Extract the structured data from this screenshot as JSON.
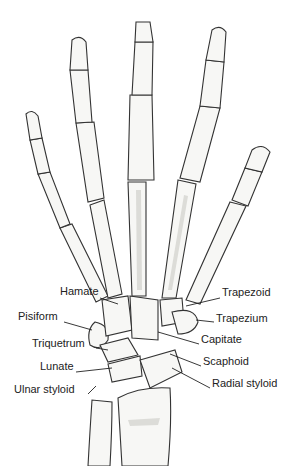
{
  "diagram": {
    "labels_left": [
      {
        "text": "Hamate",
        "x": 60,
        "y": 291
      },
      {
        "text": "Pisiform",
        "x": 18,
        "y": 316
      },
      {
        "text": "Triquetrum",
        "x": 32,
        "y": 343
      },
      {
        "text": "Lunate",
        "x": 40,
        "y": 366
      },
      {
        "text": "Ulnar styloid",
        "x": 14,
        "y": 389
      }
    ],
    "labels_right": [
      {
        "text": "Trapezoid",
        "x": 222,
        "y": 292
      },
      {
        "text": "Trapezium",
        "x": 216,
        "y": 318
      },
      {
        "text": "Capitate",
        "x": 201,
        "y": 339
      },
      {
        "text": "Scaphoid",
        "x": 203,
        "y": 361
      },
      {
        "text": "Radial styloid",
        "x": 212,
        "y": 383
      }
    ]
  }
}
